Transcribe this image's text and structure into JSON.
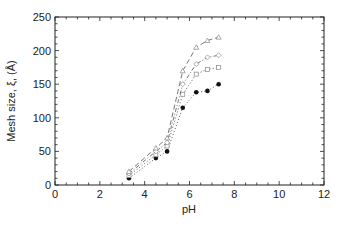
{
  "chart_data": {
    "type": "line",
    "title": "",
    "xlabel": "pH",
    "ylabel": "Mesh size, ξ, (Å)",
    "xlim": [
      0,
      12
    ],
    "ylim": [
      0,
      250
    ],
    "xticks": [
      0,
      2,
      4,
      6,
      8,
      10,
      12
    ],
    "yticks": [
      0,
      50,
      100,
      150,
      200,
      250
    ],
    "grid": false,
    "legend": "none",
    "series": [
      {
        "name": "series-1-filled-circles",
        "marker": "filled-circle",
        "line": "dotted",
        "x": [
          3.3,
          4.5,
          5.0,
          5.7,
          6.3,
          6.8,
          7.3
        ],
        "y": [
          10,
          40,
          50,
          115,
          138,
          140,
          150
        ]
      },
      {
        "name": "series-2-open-squares",
        "marker": "open-square",
        "line": "dotted",
        "x": [
          3.3,
          4.5,
          5.0,
          5.7,
          6.3,
          6.8,
          7.3
        ],
        "y": [
          14,
          45,
          58,
          135,
          165,
          172,
          175
        ]
      },
      {
        "name": "series-3-open-diamonds",
        "marker": "open-diamond",
        "line": "dash-dot",
        "x": [
          3.3,
          4.5,
          5.0,
          5.7,
          6.3,
          6.8,
          7.3
        ],
        "y": [
          17,
          50,
          63,
          150,
          180,
          190,
          193
        ]
      },
      {
        "name": "series-4-open-triangles",
        "marker": "open-triangle",
        "line": "dashed",
        "x": [
          3.3,
          4.5,
          5.0,
          5.7,
          6.3,
          6.8,
          7.3
        ],
        "y": [
          20,
          55,
          70,
          170,
          205,
          215,
          220
        ]
      }
    ]
  }
}
